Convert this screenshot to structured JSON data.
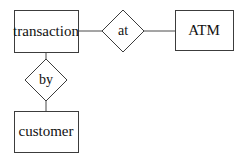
{
  "diagram": {
    "type": "entity-relationship-diagram",
    "background_color": "#ffffff",
    "line_color": "#4a4a4a",
    "text_color": "#111111",
    "entities": [
      {
        "id": "transaction",
        "label": "transaction",
        "shape": "rectangle",
        "x": 14,
        "y": 10,
        "width": 64,
        "height": 42
      },
      {
        "id": "atm",
        "label": "ATM",
        "shape": "rectangle",
        "x": 175,
        "y": 10,
        "width": 58,
        "height": 40
      },
      {
        "id": "customer",
        "label": "customer",
        "shape": "rectangle",
        "x": 14,
        "y": 111,
        "width": 64,
        "height": 41
      }
    ],
    "relationships": [
      {
        "id": "at",
        "label": "at",
        "shape": "diamond",
        "center_x": 123,
        "center_y": 31,
        "half_width": 21,
        "half_height": 21,
        "connects": [
          "transaction",
          "atm"
        ]
      },
      {
        "id": "by",
        "label": "by",
        "shape": "diamond",
        "center_x": 46,
        "center_y": 80,
        "half_width": 21,
        "half_height": 21,
        "connects": [
          "transaction",
          "customer"
        ]
      }
    ],
    "connectors": [
      {
        "id": "transaction-at",
        "x1": 78,
        "y1": 31,
        "x2": 102,
        "y2": 31
      },
      {
        "id": "at-atm",
        "x1": 144,
        "y1": 31,
        "x2": 175,
        "y2": 31
      },
      {
        "id": "transaction-by",
        "x1": 46,
        "y1": 52,
        "x2": 46,
        "y2": 59
      },
      {
        "id": "by-customer",
        "x1": 46,
        "y1": 101,
        "x2": 46,
        "y2": 111
      }
    ]
  }
}
